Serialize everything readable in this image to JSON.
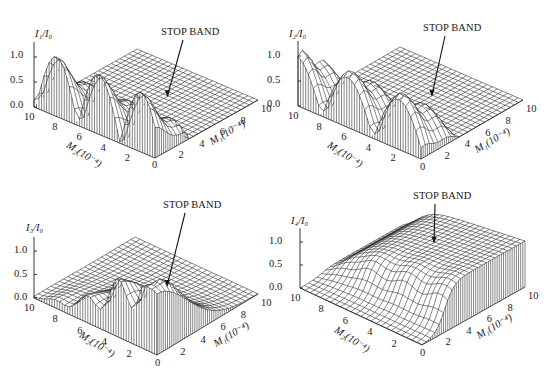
{
  "figure": {
    "panels": [
      {
        "id": "p1",
        "zlabel": "I₁/I₀",
        "annotation": "STOP BAND",
        "xlabel": "M₁(10⁻⁴)",
        "ylabel": "M₂(10⁻⁴)"
      },
      {
        "id": "p2",
        "zlabel": "I₂/I₀",
        "annotation": "STOP BAND",
        "xlabel": "M₁(10⁻⁴)",
        "ylabel": "M₂(10⁻⁴)"
      },
      {
        "id": "p3",
        "zlabel": "I₃/I₀",
        "annotation": "STOP BAND",
        "xlabel": "M₁(10⁻⁴)",
        "ylabel": "M₂(10⁻⁴)"
      },
      {
        "id": "p4",
        "zlabel": "I₄/I₀",
        "annotation": "STOP BAND",
        "xlabel": "M₁(10⁻⁴)",
        "ylabel": "M₂(10⁻⁴)"
      }
    ],
    "ztick_labels": [
      "0.0",
      "0.5",
      "1.0"
    ],
    "m1_tick_labels": [
      "2",
      "4",
      "6",
      "8",
      "10"
    ],
    "m2_tick_labels": [
      "10",
      "8",
      "6",
      "4",
      "2"
    ],
    "origin_label": "0"
  },
  "chart_data": [
    {
      "type": "surface",
      "title": "I1/I0 vs M1, M2",
      "zlabel": "I1/I0",
      "xlabel": "M1 (10^-4)",
      "ylabel": "M2 (10^-4)",
      "xlim": [
        0,
        10
      ],
      "ylim": [
        0,
        10
      ],
      "zlim": [
        0,
        1.2
      ],
      "zticks": [
        0.0,
        0.5,
        1.0
      ],
      "xticks": [
        0,
        2,
        4,
        6,
        8,
        10
      ],
      "yticks": [
        0,
        2,
        4,
        6,
        8,
        10
      ],
      "annotation": "STOP BAND",
      "description": "Oscillating lobes (peaks up to ~1.2) along small M1 across M2; flat zero plateau (stop band) for larger M1"
    },
    {
      "type": "surface",
      "title": "I2/I0 vs M1, M2",
      "zlabel": "I2/I0",
      "xlabel": "M1 (10^-4)",
      "ylabel": "M2 (10^-4)",
      "xlim": [
        0,
        10
      ],
      "ylim": [
        0,
        10
      ],
      "zlim": [
        0,
        1.2
      ],
      "zticks": [
        0.0,
        0.5,
        1.0
      ],
      "xticks": [
        0,
        2,
        4,
        6,
        8,
        10
      ],
      "yticks": [
        0,
        2,
        4,
        6,
        8,
        10
      ],
      "annotation": "STOP BAND",
      "description": "Lobes near 1.0 at small M1 along M2, decaying to zero flat stop band at larger M1"
    },
    {
      "type": "surface",
      "title": "I3/I0 vs M1, M2",
      "zlabel": "I3/I0",
      "xlabel": "M1 (10^-4)",
      "ylabel": "M2 (10^-4)",
      "xlim": [
        0,
        10
      ],
      "ylim": [
        0,
        10
      ],
      "zlim": [
        0,
        1.2
      ],
      "zticks": [
        0.0,
        0.5,
        1.0
      ],
      "xticks": [
        0,
        2,
        4,
        6,
        8,
        10
      ],
      "yticks": [
        0,
        2,
        4,
        6,
        8,
        10
      ],
      "annotation": "STOP BAND",
      "description": "Tall ridge peaks (>1.0) near small M2, falling smoothly toward zero at large M1 and large M2"
    },
    {
      "type": "surface",
      "title": "I4/I0 vs M1, M2",
      "zlabel": "I4/I0",
      "xlabel": "M1 (10^-4)",
      "ylabel": "M2 (10^-4)",
      "xlim": [
        0,
        10
      ],
      "ylim": [
        0,
        10
      ],
      "zlim": [
        0,
        1.2
      ],
      "zticks": [
        0.0,
        0.5,
        1.0
      ],
      "xticks": [
        0,
        2,
        4,
        6,
        8,
        10
      ],
      "yticks": [
        0,
        2,
        4,
        6,
        8,
        10
      ],
      "annotation": "STOP BAND",
      "description": "Near zero at small M1 rising steeply to a plateau ~1.0 for large M1 and small M2; small ripples ~0.7-0.8 along M2"
    }
  ]
}
